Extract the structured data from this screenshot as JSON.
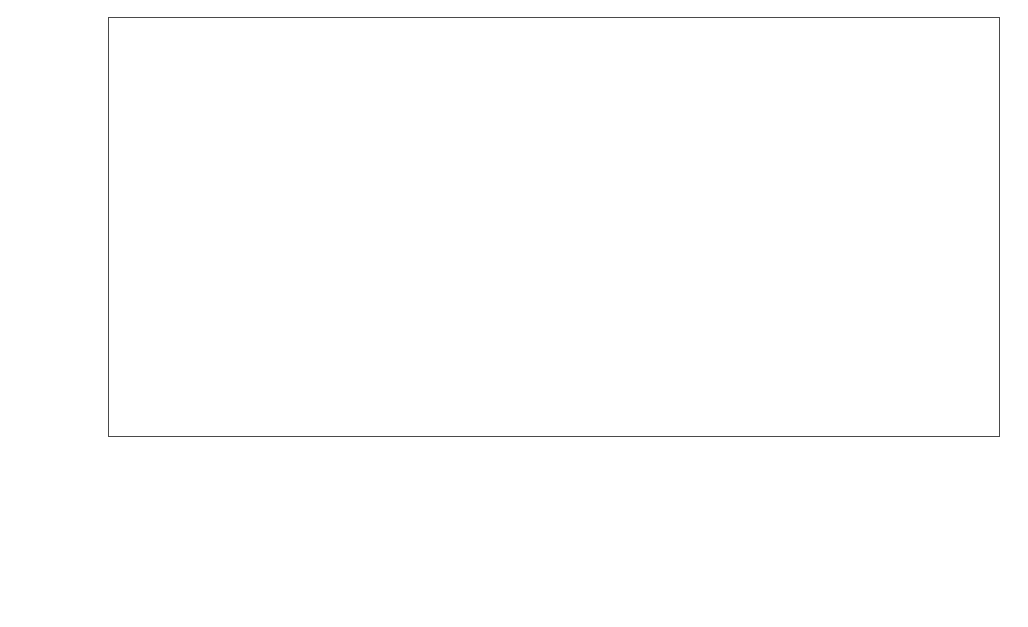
{
  "axes": {
    "ylabel": "装机容量/亿千瓦",
    "xlabel": "年份",
    "yticks": [
      "0",
      "10",
      "20",
      "30",
      "40",
      "50",
      "60",
      "70",
      "80",
      "90"
    ],
    "ymin": 0,
    "ymax": 90
  },
  "legend": {
    "row1": [
      {
        "label": "煤电",
        "color": "#3a5f96",
        "x": 90
      },
      {
        "label": "气电",
        "color": "#ee8337",
        "x": 222
      },
      {
        "label": "其他火电",
        "color": "#a6a6a6",
        "x": 330
      },
      {
        "label": "核电",
        "color": "#f5c33f",
        "x": 470
      },
      {
        "label": "水电(不含抽蓄)",
        "color": "#5a7fbf",
        "x": 617
      }
    ],
    "row2": [
      {
        "label": "陆上风电",
        "color": "#6d9247",
        "x": 90
      },
      {
        "label": "海上风电",
        "color": "#c3d6d8",
        "x": 222
      },
      {
        "label": "光伏",
        "color": "#bce19a",
        "x": 354
      },
      {
        "label": "其他可再生电力",
        "color": "#4f4f4f",
        "x": 470
      }
    ]
  },
  "chart_data": {
    "type": "area",
    "stacked": true,
    "title": "",
    "xlabel": "年份",
    "ylabel": "装机容量/亿千瓦",
    "ylim": [
      0,
      90
    ],
    "grid": false,
    "legend_position": "bottom",
    "x": [
      2019,
      2020,
      2021,
      2022,
      2023,
      2024,
      2025,
      2026,
      2027,
      2028,
      2029,
      2030,
      2031,
      2032,
      2033,
      2034,
      2035,
      2036,
      2037,
      2038,
      2039,
      2040,
      2041,
      2042,
      2043,
      2044,
      2045,
      2046,
      2047,
      2048,
      2049,
      2050,
      2051,
      2052,
      2053,
      2054,
      2055,
      2056,
      2057,
      2058,
      2059,
      2060
    ],
    "series": [
      {
        "name": "煤电",
        "color": "#3a5f96",
        "values": [
          10.4,
          10.8,
          11.2,
          11.6,
          12.0,
          12.4,
          12.7,
          13.0,
          13.2,
          13.4,
          13.6,
          13.7,
          13.8,
          13.9,
          13.9,
          13.9,
          13.9,
          13.8,
          13.7,
          13.6,
          13.4,
          13.2,
          13.0,
          12.7,
          12.4,
          12.0,
          11.6,
          11.2,
          10.8,
          10.3,
          9.8,
          9.2,
          8.6,
          8.0,
          7.4,
          6.8,
          6.2,
          5.7,
          5.2,
          4.8,
          4.5,
          4.3
        ]
      },
      {
        "name": "气电",
        "color": "#ee8337",
        "values": [
          0.9,
          1.0,
          1.1,
          1.2,
          1.3,
          1.4,
          1.5,
          1.6,
          1.7,
          1.8,
          1.9,
          2.0,
          2.0,
          2.1,
          2.1,
          2.2,
          2.2,
          2.2,
          2.2,
          2.2,
          2.2,
          2.2,
          2.2,
          2.2,
          2.2,
          2.2,
          2.1,
          2.1,
          2.1,
          2.0,
          2.0,
          2.0,
          1.9,
          1.9,
          1.8,
          1.8,
          1.7,
          1.7,
          1.6,
          1.6,
          1.5,
          1.5
        ]
      },
      {
        "name": "其他火电",
        "color": "#a6a6a6",
        "values": [
          0.15,
          0.15,
          0.16,
          0.16,
          0.17,
          0.17,
          0.18,
          0.18,
          0.19,
          0.19,
          0.2,
          0.2,
          0.2,
          0.21,
          0.21,
          0.21,
          0.22,
          0.22,
          0.22,
          0.22,
          0.22,
          0.22,
          0.22,
          0.22,
          0.22,
          0.22,
          0.22,
          0.22,
          0.22,
          0.22,
          0.22,
          0.22,
          0.22,
          0.22,
          0.22,
          0.22,
          0.22,
          0.22,
          0.22,
          0.22,
          0.22,
          0.22
        ]
      },
      {
        "name": "核电",
        "color": "#f5c33f",
        "values": [
          0.5,
          0.6,
          0.7,
          0.8,
          0.9,
          1.0,
          1.1,
          1.2,
          1.3,
          1.4,
          1.5,
          1.6,
          1.7,
          1.8,
          1.9,
          2.0,
          2.1,
          2.2,
          2.3,
          2.4,
          2.5,
          2.6,
          2.7,
          2.8,
          2.9,
          3.0,
          3.1,
          3.2,
          3.3,
          3.4,
          3.5,
          3.6,
          3.7,
          3.8,
          3.9,
          4.0,
          4.1,
          4.2,
          4.3,
          4.4,
          4.5,
          4.6
        ]
      },
      {
        "name": "水电(不含抽蓄)",
        "color": "#5a7fbf",
        "values": [
          3.6,
          3.8,
          4.0,
          4.2,
          4.4,
          4.6,
          4.8,
          4.9,
          5.0,
          5.1,
          5.2,
          5.3,
          5.4,
          5.4,
          5.5,
          5.5,
          5.6,
          5.6,
          5.7,
          5.7,
          5.8,
          5.8,
          5.9,
          5.9,
          6.0,
          6.0,
          6.1,
          6.1,
          6.2,
          6.2,
          6.3,
          6.3,
          6.4,
          6.4,
          6.5,
          6.5,
          6.6,
          6.6,
          6.7,
          6.7,
          6.8,
          6.8
        ]
      },
      {
        "name": "陆上风电",
        "color": "#6d9247",
        "values": [
          2.1,
          2.7,
          3.4,
          4.2,
          5.0,
          5.9,
          6.9,
          7.8,
          8.7,
          9.6,
          10.5,
          11.3,
          12.1,
          12.9,
          13.6,
          14.3,
          15.0,
          15.7,
          16.3,
          16.9,
          17.5,
          18.1,
          18.6,
          19.1,
          19.6,
          20.1,
          20.6,
          21.0,
          21.5,
          21.9,
          22.3,
          22.7,
          23.0,
          23.4,
          23.7,
          24.0,
          24.3,
          24.6,
          24.8,
          25.0,
          25.2,
          25.4
        ]
      },
      {
        "name": "海上风电",
        "color": "#c3d6d8",
        "values": [
          0.1,
          0.15,
          0.2,
          0.3,
          0.4,
          0.5,
          0.65,
          0.8,
          0.95,
          1.1,
          1.3,
          1.5,
          1.7,
          1.9,
          2.1,
          2.3,
          2.5,
          2.7,
          2.9,
          3.1,
          3.3,
          3.5,
          3.7,
          3.9,
          4.1,
          4.3,
          4.5,
          4.7,
          4.8,
          5.0,
          5.2,
          5.3,
          5.5,
          5.6,
          5.7,
          5.8,
          5.9,
          6.0,
          6.1,
          6.2,
          6.3,
          6.4
        ]
      },
      {
        "name": "光伏",
        "color": "#bce19a",
        "values": [
          2.0,
          3.0,
          4.3,
          5.8,
          7.5,
          9.4,
          11.4,
          13.3,
          15.1,
          16.9,
          18.6,
          20.2,
          21.7,
          23.1,
          24.4,
          25.6,
          26.8,
          27.9,
          28.9,
          29.9,
          30.8,
          31.6,
          32.4,
          33.1,
          33.7,
          34.3,
          34.8,
          35.2,
          35.6,
          35.9,
          36.2,
          36.4,
          36.5,
          36.6,
          36.6,
          36.6,
          36.5,
          36.4,
          36.3,
          36.2,
          36.1,
          36.0
        ]
      },
      {
        "name": "其他可再生电力",
        "color": "#4f4f4f",
        "values": [
          0.1,
          0.12,
          0.14,
          0.16,
          0.18,
          0.2,
          0.22,
          0.25,
          0.28,
          0.3,
          0.33,
          0.36,
          0.38,
          0.4,
          0.42,
          0.44,
          0.46,
          0.48,
          0.5,
          0.52,
          0.54,
          0.55,
          0.56,
          0.57,
          0.58,
          0.59,
          0.6,
          0.6,
          0.6,
          0.6,
          0.6,
          0.6,
          0.6,
          0.6,
          0.6,
          0.6,
          0.6,
          0.6,
          0.6,
          0.6,
          0.6,
          0.6
        ]
      }
    ]
  }
}
